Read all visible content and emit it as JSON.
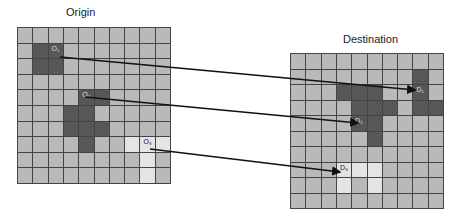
{
  "titles": {
    "origin": "Origin",
    "destination": "Destination"
  },
  "colors": {
    "cell": "#b9b9b9",
    "dark": "#575757",
    "light": "#e4e4e4",
    "grid_line": "#444444",
    "arrow": "#111111"
  },
  "origin_grid": {
    "rows": 10,
    "cols": 10,
    "dark": [
      [
        1,
        1
      ],
      [
        1,
        2
      ],
      [
        2,
        1
      ],
      [
        2,
        2
      ],
      [
        4,
        4
      ],
      [
        4,
        5
      ],
      [
        5,
        3
      ],
      [
        5,
        4
      ],
      [
        6,
        3
      ],
      [
        6,
        4
      ],
      [
        6,
        5
      ],
      [
        7,
        4
      ]
    ],
    "light": [
      [
        7,
        7
      ],
      [
        7,
        8
      ],
      [
        7,
        9
      ],
      [
        8,
        8
      ],
      [
        9,
        8
      ]
    ],
    "labels": [
      {
        "row": 1,
        "col": 2,
        "text": "O₁"
      },
      {
        "row": 4,
        "col": 4,
        "text": "O₂"
      },
      {
        "row": 7,
        "col": 8,
        "text": "O₃"
      }
    ]
  },
  "destination_grid": {
    "rows": 10,
    "cols": 10,
    "dark": [
      [
        1,
        8
      ],
      [
        2,
        3
      ],
      [
        2,
        4
      ],
      [
        2,
        5
      ],
      [
        2,
        8
      ],
      [
        3,
        4
      ],
      [
        3,
        5
      ],
      [
        3,
        6
      ],
      [
        3,
        8
      ],
      [
        3,
        9
      ],
      [
        4,
        4
      ],
      [
        4,
        5
      ],
      [
        5,
        5
      ]
    ],
    "light": [
      [
        7,
        3
      ],
      [
        7,
        4
      ],
      [
        7,
        5
      ],
      [
        8,
        3
      ],
      [
        8,
        5
      ]
    ],
    "labels": [
      {
        "row": 2,
        "col": 8,
        "text": "D₁"
      },
      {
        "row": 4,
        "col": 4,
        "text": "D₂"
      },
      {
        "row": 7,
        "col": 3,
        "text": "D₃"
      }
    ]
  },
  "arrows": [
    {
      "from": "O₁",
      "to": "D₁",
      "x1": 60,
      "y1": 57,
      "x2": 415,
      "y2": 90
    },
    {
      "from": "O₂",
      "to": "D₂",
      "x1": 85,
      "y1": 97,
      "x2": 358,
      "y2": 123
    },
    {
      "from": "O₃",
      "to": "D₃",
      "x1": 150,
      "y1": 149,
      "x2": 340,
      "y2": 172
    }
  ]
}
